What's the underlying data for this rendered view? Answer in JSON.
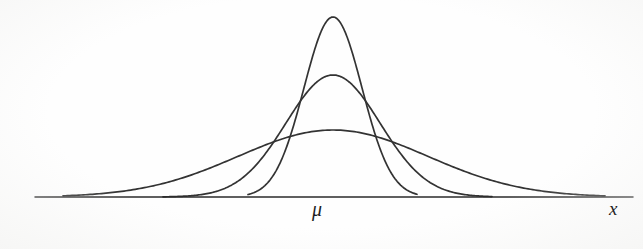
{
  "figure": {
    "background_color": "#fefefe",
    "line_color": "#333333",
    "axis_color": "#2b2b2b"
  },
  "labels": {
    "mean_symbol": "μ",
    "variable_symbol": "x"
  },
  "chart_data": {
    "type": "line",
    "title": "",
    "subtitle": "",
    "xlabel": "x",
    "ylabel": "",
    "grid": false,
    "legend_position": "none",
    "annotations": [
      {
        "text": "μ",
        "x_px": 322,
        "y_px": 210,
        "role": "mean-tick-label"
      },
      {
        "text": "x",
        "x_px": 616,
        "y_px": 208,
        "role": "x-axis-label"
      }
    ],
    "axis": {
      "x_start_px": 35,
      "x_end_px": 633,
      "baseline_y_px": 197,
      "mean_x_px": 333,
      "xlim_px": [
        35,
        633
      ],
      "ticks": [
        "μ"
      ]
    },
    "series": [
      {
        "name": "small standard deviation (tall narrow curve)",
        "mean_px": 333,
        "sigma_px": 29,
        "peak_x_px": 331,
        "peak_y_px": 17,
        "peak_height_px": 180,
        "left_end_x_px": 248,
        "right_end_x_px": 417,
        "relative_peak": 1.0,
        "relative_sigma": 1.0
      },
      {
        "name": "medium standard deviation (middle curve)",
        "mean_px": 333,
        "sigma_px": 47,
        "peak_x_px": 333,
        "peak_y_px": 75,
        "peak_height_px": 122,
        "left_end_x_px": 163,
        "right_end_x_px": 492,
        "relative_peak": 0.68,
        "relative_sigma": 1.62
      },
      {
        "name": "large standard deviation (flat wide curve)",
        "mean_px": 333,
        "sigma_px": 95,
        "peak_x_px": 335,
        "peak_y_px": 130,
        "peak_height_px": 67,
        "left_end_x_px": 63,
        "right_end_x_px": 605,
        "relative_peak": 0.37,
        "relative_sigma": 3.28
      }
    ]
  }
}
